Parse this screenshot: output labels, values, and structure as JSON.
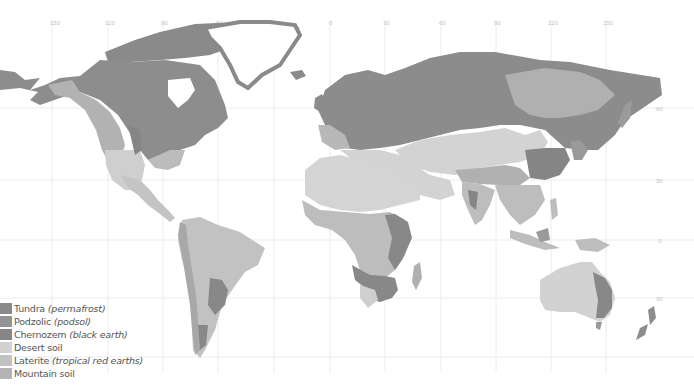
{
  "map": {
    "title": "World soil types",
    "longitude_ticks_top": [
      "150",
      "120",
      "90",
      "60",
      "30",
      "0",
      "30",
      "60",
      "90",
      "120",
      "150"
    ],
    "latitude_ticks_right": [
      "60",
      "30",
      "0",
      "30",
      "60"
    ],
    "colors": {
      "ocean": "#ffffff",
      "tundra": "#8a8a8a",
      "podzolic": "#909090",
      "chernozem": "#7f7f7f",
      "desert": "#d4d4d4",
      "laterite": "#bdbdbd",
      "mountain": "#b0b0b0",
      "ice": "#ffffff",
      "grid": "#ececec"
    }
  },
  "legend": {
    "items": [
      {
        "key": "tundra",
        "label": "Tundra",
        "note": "(permafrost)",
        "color": "#8a8a8a"
      },
      {
        "key": "podzolic",
        "label": "Podzolic",
        "note": "(podsol)",
        "color": "#939393"
      },
      {
        "key": "chernozem",
        "label": "Chernozem",
        "note": "(black earth)",
        "color": "#868686"
      },
      {
        "key": "desert",
        "label": "Desert soil",
        "note": "",
        "color": "#d2d2d2"
      },
      {
        "key": "laterite",
        "label": "Laterite",
        "note": "(tropical red earths)",
        "color": "#c2c2c2"
      },
      {
        "key": "mountain",
        "label": "Mountain soil",
        "note": "",
        "color": "#b4b4b4"
      }
    ]
  }
}
